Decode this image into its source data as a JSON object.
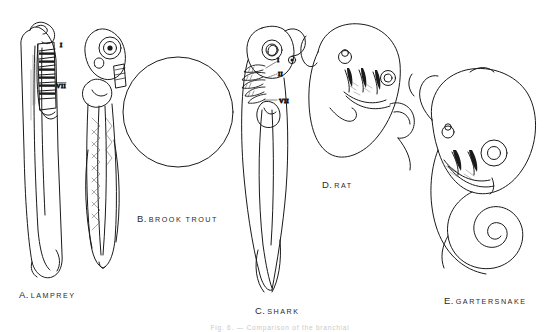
{
  "plate": {
    "background_color": "#ffffff",
    "ink_color": "#1a1a1a",
    "caption": "Fig. 6. — Comparison of the branchial",
    "figures": [
      {
        "key": "A",
        "letter": "A.",
        "name": "LAMPREY",
        "annotations": [
          {
            "text": "I",
            "meaning": "first-branchial-arch"
          },
          {
            "text": "VII",
            "meaning": "seventh-branchial-arch"
          }
        ]
      },
      {
        "key": "B",
        "letter": "B.",
        "name": "BROOK TROUT",
        "annotations": []
      },
      {
        "key": "C",
        "letter": "C.",
        "name": "SHARK",
        "annotations": [
          {
            "text": "I",
            "meaning": "first-branchial-arch"
          },
          {
            "text": "II",
            "meaning": "second-branchial-arch"
          },
          {
            "text": "VII",
            "meaning": "seventh-branchial-arch"
          }
        ]
      },
      {
        "key": "D",
        "letter": "D.",
        "name": "RAT",
        "annotations": []
      },
      {
        "key": "E",
        "letter": "E.",
        "name": "GARTERSNAKE",
        "annotations": []
      }
    ]
  }
}
